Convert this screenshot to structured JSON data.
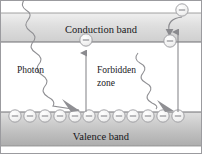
{
  "figure": {
    "type": "energy-band-diagram",
    "width": 202,
    "height": 154
  },
  "colors": {
    "background": "#ffffff",
    "band_fill_light": "#e3e3e3",
    "band_fill_dark": "#b4b4b4",
    "band_edge": "#8c8c8c",
    "text": "#17171a",
    "line": "#8e8e92",
    "carrier_fill": "#f2f2f2",
    "carrier_edge": "#9a9a9e",
    "border": "#9b9b9f"
  },
  "labels": {
    "conduction_band": "Conduction band",
    "valence_band": "Valence band",
    "photon": "Photon",
    "forbidden_zone_line1": "Forbidden",
    "forbidden_zone_line2": "zone"
  },
  "bands": {
    "conduction": {
      "name": "Conduction band",
      "top_y": 13,
      "bottom_y": 42,
      "label_x": 101,
      "label_y": 29
    },
    "valence": {
      "name": "Valence band",
      "top_y": 112,
      "bottom_y": 146,
      "label_x": 101,
      "label_y": 136
    },
    "forbidden": {
      "name": "Forbidden zone",
      "top_y": 42,
      "bottom_y": 112
    }
  },
  "carriers": {
    "valence_electron_count": 12,
    "valence_electron_y": 116,
    "valence_electron_r": 6.2,
    "valence_electron_xs": [
      15,
      30,
      45,
      60,
      75,
      89,
      104,
      119,
      133,
      148,
      163,
      178
    ],
    "excited_electron": {
      "x": 86,
      "y": 40,
      "r": 6.2
    },
    "recombining_electron_top": {
      "x": 182,
      "y": 10,
      "r": 6.2
    },
    "recombining_electron_bottom": {
      "x": 170,
      "y": 41,
      "r": 6.2
    }
  },
  "arrows": {
    "left_photon": {
      "name": "photon-absorption-wave-left",
      "start": {
        "x": 24,
        "y": 0
      },
      "end": {
        "x": 79,
        "y": 110
      },
      "style": "wavy-arrow"
    },
    "right_photon": {
      "name": "photon-emission-wave-right",
      "start": {
        "x": 138,
        "y": 53
      },
      "end": {
        "x": 173,
        "y": 110
      },
      "style": "wavy-arrow"
    },
    "excitation": {
      "name": "electron-excitation-arrow",
      "x": 86,
      "from_y": 112,
      "to_y": 47,
      "direction": "up"
    },
    "recombination": {
      "name": "electron-recombination-arrow",
      "x": 178,
      "from_y": 112,
      "to_y": 26,
      "direction": "up"
    },
    "capture": {
      "name": "electron-capture-curved-arrow",
      "from": {
        "x": 182,
        "y": 17
      },
      "to": {
        "x": 170,
        "y": 34
      },
      "direction": "down"
    }
  },
  "legend": {
    "carrier_sign": "−"
  }
}
